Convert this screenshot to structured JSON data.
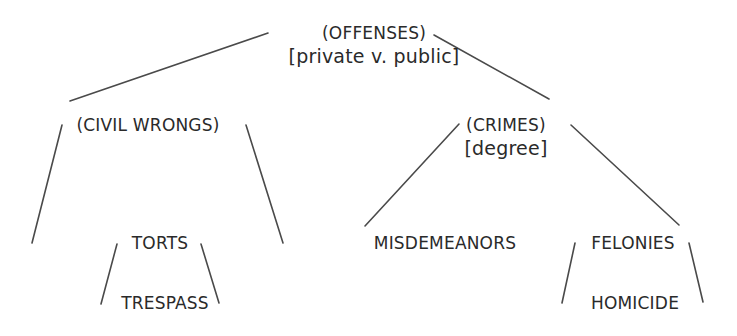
{
  "diagram": {
    "type": "tree",
    "colors": {
      "text": "#2a2a2a",
      "lines": "#4a4a4a",
      "background": "#ffffff"
    },
    "nodes": {
      "offenses": {
        "label": "(OFFENSES)",
        "sub": "[private v. public]"
      },
      "civil_wrongs": {
        "label": "(CIVIL WRONGS)"
      },
      "crimes": {
        "label": "(CRIMES)",
        "sub": "[degree]"
      },
      "torts": {
        "label": "TORTS"
      },
      "trespass": {
        "label": "TRESPASS"
      },
      "misdemeanors": {
        "label": "MISDEMEANORS"
      },
      "felonies": {
        "label": "FELONIES"
      },
      "homicide": {
        "label": "HOMICIDE"
      }
    },
    "edges": [
      {
        "from": "offenses",
        "to": "civil_wrongs"
      },
      {
        "from": "offenses",
        "to": "crimes"
      },
      {
        "from": "civil_wrongs",
        "to": "(left open branch)"
      },
      {
        "from": "civil_wrongs",
        "to": "(right open branch)"
      },
      {
        "from": "torts",
        "to": "trespass",
        "style": "bracket"
      },
      {
        "from": "crimes",
        "to": "misdemeanors"
      },
      {
        "from": "crimes",
        "to": "felonies"
      },
      {
        "from": "felonies",
        "to": "homicide",
        "style": "bracket"
      }
    ]
  }
}
